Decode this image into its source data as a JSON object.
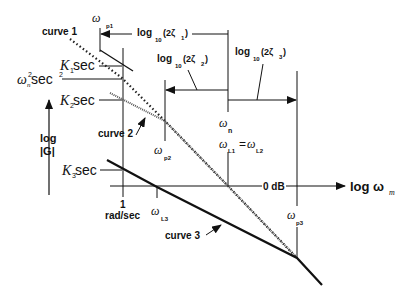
{
  "diagram": {
    "type": "bode-magnitude-asymptotes",
    "y_axis_label_line1": "log",
    "y_axis_label_line2": "|G|",
    "x_axis_label": "log ω",
    "x_axis_label_sub": "m",
    "zero_db_label": "0 dB",
    "x_tick_1_line1": "1",
    "x_tick_1_line2": "rad/sec",
    "y_labels": {
      "k1": {
        "base": "K",
        "sub": "1",
        "unit": " sec"
      },
      "wn2": {
        "base": "ω",
        "sub": "n",
        "sup": "2",
        "unit": " sec",
        "unit_sup": "2"
      },
      "k2": {
        "base": "K",
        "sub": "2",
        "unit": " sec"
      },
      "k3": {
        "base": "K",
        "sub": "3",
        "unit": " sec"
      }
    },
    "curves": [
      {
        "label": "curve 1",
        "style": "dotted"
      },
      {
        "label": "curve 2",
        "style": "hatched"
      },
      {
        "label": "curve 3",
        "style": "solid"
      }
    ],
    "frequencies": {
      "wp1": {
        "base": "ω",
        "sub": "p1"
      },
      "wp2": {
        "base": "ω",
        "sub": "p2"
      },
      "wp3": {
        "base": "ω",
        "sub": "p3"
      },
      "wn": {
        "base": "ω",
        "sub": "n"
      },
      "wL1": {
        "base": "ω",
        "sub": "L1"
      },
      "eq": "=",
      "wL2": {
        "base": "ω",
        "sub": "L2"
      },
      "wL3": {
        "base": "ω",
        "sub": "L3"
      }
    },
    "spans": [
      {
        "log": "log",
        "sub": "10",
        "arg_open": "(2ζ",
        "arg_sub": "1",
        "arg_close": ")"
      },
      {
        "log": "log",
        "sub": "10",
        "arg_open": "(2ζ",
        "arg_sub": "2",
        "arg_close": ")"
      },
      {
        "log": "log",
        "sub": "10",
        "arg_open": "(2ζ",
        "arg_sub": "3",
        "arg_close": ")"
      }
    ]
  }
}
